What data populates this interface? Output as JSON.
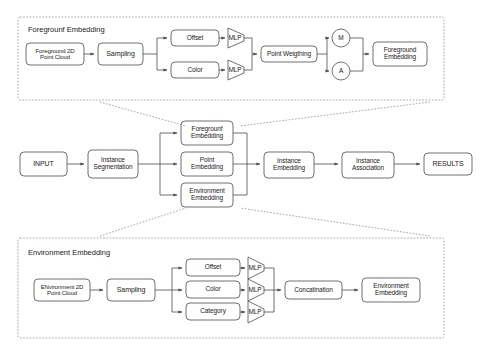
{
  "diagram": {
    "stroke_color": "#4d4d4d",
    "panel_border_color": "#999999",
    "text_color": "#1a1a1a",
    "fill_color": "#ffffff"
  },
  "panels": {
    "foreground": {
      "title": "Foregrounf Embedding",
      "x": 18,
      "y": 17,
      "w": 426,
      "h": 83
    },
    "environment": {
      "title": "Environment Embedding",
      "x": 18,
      "y": 238,
      "w": 426,
      "h": 100
    }
  },
  "foreground_nodes": {
    "input": "Foreground 2D\nPoint Cloud",
    "sampling": "Sampling",
    "offset": "Offset",
    "color": "Color",
    "mlp_offset": "MLP",
    "mlp_color": "MLP",
    "point_weighting": "Point Weigthing",
    "m": "M",
    "a": "A",
    "output": "Foreground\nEmbedding"
  },
  "main_nodes": {
    "input": "INPUT",
    "instance_segmentation": "Instance\nSegmentation",
    "foreground_embedding": "Foregrounf\nEmbedding",
    "point_embedding": "Point\nEmbedding",
    "environment_embedding": "Environment\nEmbedding",
    "instance_embedding": "Instance\nEmbedding",
    "instance_association": "Instance\nAssociation",
    "results": "RESULTS"
  },
  "environment_nodes": {
    "input": "ENvironment 2D\nPoint Cloud",
    "sampling": "Sampling",
    "offset": "Offset",
    "color": "Color",
    "category": "Category",
    "mlp_offset": "MLP",
    "mlp_color": "MLP",
    "mlp_category": "MLP",
    "concatenation": "Concatination",
    "output": "Environment\nEmbedding"
  }
}
